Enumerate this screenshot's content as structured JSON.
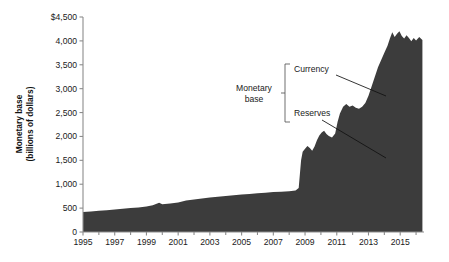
{
  "chart_data": {
    "type": "area",
    "title": "",
    "xlabel": "",
    "ylabel": "Monetary base (billions of dollars)",
    "ylabel_line1": "Monetary base",
    "ylabel_line2": "(billions of dollars)",
    "xlim": [
      1995,
      2016.5
    ],
    "ylim": [
      0,
      4500
    ],
    "grid": false,
    "legend_position": "none",
    "series_name": "Monetary base",
    "area_color": "#3c3c3c",
    "axis_color": "#8c8c8c",
    "background_color": "#ffffff",
    "y_ticks": [
      0,
      500,
      1000,
      1500,
      2000,
      2500,
      3000,
      3500,
      4000,
      4500
    ],
    "y_tick_labels": [
      "0",
      "500",
      "1,000",
      "1,500",
      "2,000",
      "2,500",
      "3,000",
      "3,500",
      "4,000",
      "$4,500"
    ],
    "x_ticks": [
      1995,
      1997,
      1999,
      2001,
      2003,
      2005,
      2007,
      2009,
      2011,
      2013,
      2015
    ],
    "x_tick_labels": [
      "1995",
      "1997",
      "1999",
      "2001",
      "2003",
      "2005",
      "2007",
      "2009",
      "2011",
      "2013",
      "2015"
    ],
    "x_minor_ticks": [
      1996,
      1998,
      2000,
      2002,
      2004,
      2006,
      2008,
      2010,
      2012,
      2014,
      2016
    ],
    "x": [
      1995.0,
      1995.5,
      1996.0,
      1996.5,
      1997.0,
      1997.5,
      1998.0,
      1998.5,
      1999.0,
      1999.4,
      1999.8,
      2000.0,
      2000.5,
      2001.0,
      2001.5,
      2002.0,
      2002.5,
      2003.0,
      2003.5,
      2004.0,
      2004.5,
      2005.0,
      2005.5,
      2006.0,
      2006.5,
      2007.0,
      2007.5,
      2008.0,
      2008.4,
      2008.6,
      2008.75,
      2008.85,
      2009.0,
      2009.15,
      2009.3,
      2009.45,
      2009.6,
      2009.75,
      2009.9,
      2010.05,
      2010.2,
      2010.35,
      2010.5,
      2010.7,
      2010.9,
      2011.05,
      2011.2,
      2011.4,
      2011.6,
      2011.8,
      2012.0,
      2012.2,
      2012.4,
      2012.6,
      2012.8,
      2013.0,
      2013.2,
      2013.4,
      2013.6,
      2013.8,
      2014.0,
      2014.2,
      2014.35,
      2014.5,
      2014.65,
      2014.8,
      2014.95,
      2015.1,
      2015.25,
      2015.4,
      2015.55,
      2015.7,
      2015.85,
      2016.0,
      2016.2,
      2016.4
    ],
    "values": [
      420,
      430,
      445,
      455,
      470,
      485,
      500,
      515,
      535,
      560,
      610,
      580,
      595,
      615,
      660,
      680,
      700,
      720,
      740,
      755,
      770,
      785,
      795,
      810,
      820,
      835,
      845,
      855,
      870,
      920,
      1500,
      1680,
      1740,
      1800,
      1760,
      1700,
      1790,
      1920,
      2020,
      2080,
      2120,
      2050,
      2010,
      1980,
      2060,
      2300,
      2480,
      2620,
      2680,
      2620,
      2650,
      2600,
      2580,
      2620,
      2700,
      2850,
      3050,
      3250,
      3450,
      3600,
      3750,
      3900,
      4050,
      4180,
      4080,
      4150,
      4200,
      4100,
      4050,
      4120,
      4060,
      3990,
      4060,
      4010,
      4080,
      4020
    ],
    "annotations": [
      {
        "name": "monetary-base",
        "text": "Monetary base",
        "line1": "Monetary",
        "line2": "base"
      },
      {
        "name": "currency",
        "text": "Currency"
      },
      {
        "name": "reserves",
        "text": "Reserves"
      }
    ]
  }
}
